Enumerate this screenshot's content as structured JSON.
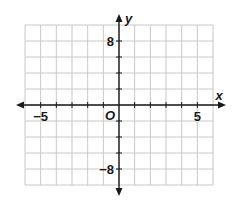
{
  "chart_data": {
    "type": "scatter",
    "title": "",
    "xlabel": "x",
    "ylabel": "y",
    "origin_label": "O",
    "xlim": [
      -6,
      6
    ],
    "ylim": [
      -10,
      10
    ],
    "x_grid_step": 1,
    "y_grid_step": 2,
    "grid": true,
    "x_tick_labels": [
      {
        "value": -5,
        "label": "−5"
      },
      {
        "value": 5,
        "label": "5"
      }
    ],
    "y_tick_labels": [
      {
        "value": 8,
        "label": "8"
      },
      {
        "value": -8,
        "label": "−8"
      }
    ],
    "series": [],
    "colors": {
      "grid": "#c8c8c8",
      "axis": "#1a1a1a"
    }
  }
}
